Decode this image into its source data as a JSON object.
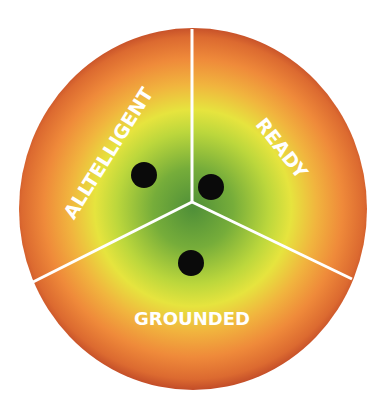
{
  "diagram": {
    "type": "three-segment radial diagram",
    "segments": [
      {
        "label": "ALLTELLIGENT",
        "position": "upper-left"
      },
      {
        "label": "READY",
        "position": "upper-right"
      },
      {
        "label": "GROUNDED",
        "position": "bottom"
      }
    ],
    "dots": 3,
    "colors": {
      "center": "#55963a",
      "inner": "#8cbc3a",
      "mid": "#e3e43e",
      "outer": "#ef8c3c",
      "edge": "#c34e2a",
      "divider": "#ffffff",
      "dot": "#0a0a0a",
      "label": "#ffffff"
    }
  }
}
